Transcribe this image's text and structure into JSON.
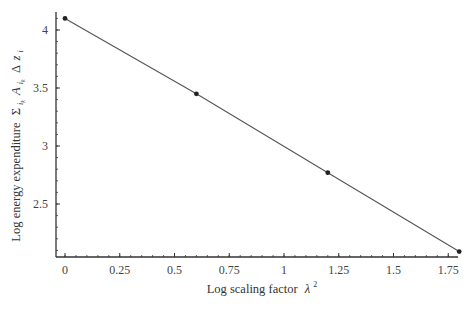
{
  "chart_data": {
    "type": "line",
    "title": "",
    "xlabel": "Log scaling factor λ²",
    "xlabel_text": "Log scaling factor",
    "xlabel_symbol": "λ",
    "xlabel_sup": "2",
    "ylabel": "Log energy expenditure Σ_{i_k} A_{i_k} Δ z_i",
    "ylabel_text": "Log energy expenditure",
    "ylabel_symbol": "Σ",
    "x_ticks": [
      "0",
      "0.25",
      "0.5",
      "0.75",
      "1",
      "1.25",
      "1.5",
      "1.75"
    ],
    "y_ticks": [
      "2.5",
      "3",
      "3.5",
      "4"
    ],
    "xlim": [
      -0.04,
      1.84
    ],
    "ylim": [
      2.05,
      4.2
    ],
    "grid": false,
    "legend": "none",
    "series": [
      {
        "name": "energy expenditure",
        "marker": "circle",
        "x": [
          0,
          0.6,
          1.2,
          1.8
        ],
        "y": [
          4.1,
          3.45,
          2.77,
          2.09
        ]
      }
    ],
    "colors": {
      "line": "#555555",
      "marker": "#222222",
      "axis": "#333333"
    }
  }
}
